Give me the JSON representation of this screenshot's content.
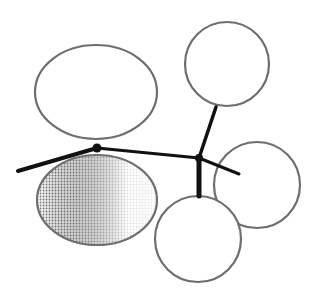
{
  "diagram": {
    "title": "",
    "width": 321,
    "height": 299,
    "colors": {
      "background": "#ffffff",
      "outline": "#6e6e6e",
      "connector": "#111111",
      "shade_dark": "#8a8a8a",
      "shade_light": "#ffffff"
    },
    "shapes": [
      {
        "id": "ellipse-top-left",
        "type": "ellipse",
        "cx": 96,
        "cy": 92,
        "rx": 61,
        "ry": 47,
        "filled": false
      },
      {
        "id": "ellipse-shaded",
        "type": "ellipse",
        "cx": 97,
        "cy": 200,
        "rx": 60,
        "ry": 45,
        "filled": true
      },
      {
        "id": "circle-top-right",
        "type": "circle",
        "cx": 227,
        "cy": 64,
        "r": 42,
        "filled": false
      },
      {
        "id": "circle-right",
        "type": "circle",
        "cx": 257,
        "cy": 185,
        "r": 43,
        "filled": false
      },
      {
        "id": "circle-bottom",
        "type": "circle",
        "cx": 198,
        "cy": 239,
        "r": 43,
        "filled": false
      }
    ],
    "nodes": [
      {
        "id": "junction-left",
        "x": 97,
        "y": 148,
        "r": 4.5
      },
      {
        "id": "junction-right",
        "x": 199,
        "y": 158,
        "r": 4
      }
    ],
    "edges": [
      {
        "id": "edge-left-tail",
        "x1": 18,
        "y1": 171,
        "x2": 97,
        "y2": 148,
        "width": 4
      },
      {
        "id": "edge-junction-link",
        "x1": 97,
        "y1": 148,
        "x2": 199,
        "y2": 158,
        "width": 3
      },
      {
        "id": "edge-to-top-right",
        "x1": 199,
        "y1": 158,
        "x2": 216,
        "y2": 107,
        "width": 3.5
      },
      {
        "id": "edge-to-right",
        "x1": 199,
        "y1": 158,
        "x2": 239,
        "y2": 174,
        "width": 3
      },
      {
        "id": "edge-to-bottom",
        "x1": 199,
        "y1": 158,
        "x2": 199,
        "y2": 196,
        "width": 5
      }
    ]
  }
}
